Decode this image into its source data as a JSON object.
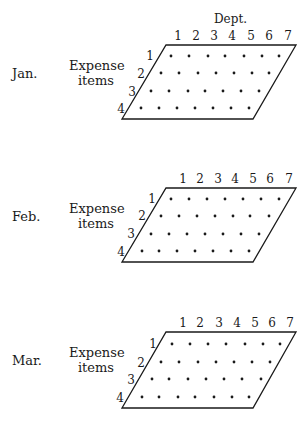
{
  "dept_label": "Dept.",
  "axis_label": "Expense items",
  "axis_label_line1": "Expense",
  "axis_label_line2": "items",
  "dept_ticks": [
    "1",
    "2",
    "3",
    "4",
    "5",
    "6",
    "7"
  ],
  "item_ticks": [
    "1",
    "2",
    "3",
    "4"
  ],
  "panels": [
    {
      "month": "Jan."
    },
    {
      "month": "Feb."
    },
    {
      "month": "Mar."
    }
  ],
  "colors": {
    "ink": "#1a1a1a",
    "background": "#ffffff"
  }
}
